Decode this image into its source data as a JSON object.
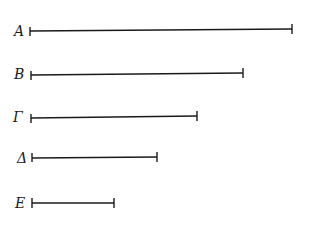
{
  "diagram": {
    "type": "line-segments",
    "segments": [
      {
        "label": "A",
        "x_start": 30,
        "x_end": 292,
        "y": 31
      },
      {
        "label": "B",
        "x_start": 31,
        "x_end": 243,
        "y": 74
      },
      {
        "label": "Γ",
        "x_start": 31,
        "x_end": 197,
        "y": 117
      },
      {
        "label": "Δ",
        "x_start": 32,
        "x_end": 157,
        "y": 158
      },
      {
        "label": "E",
        "x_start": 32,
        "x_end": 114,
        "y": 203
      }
    ],
    "stroke_color": "#1a1a1a"
  }
}
